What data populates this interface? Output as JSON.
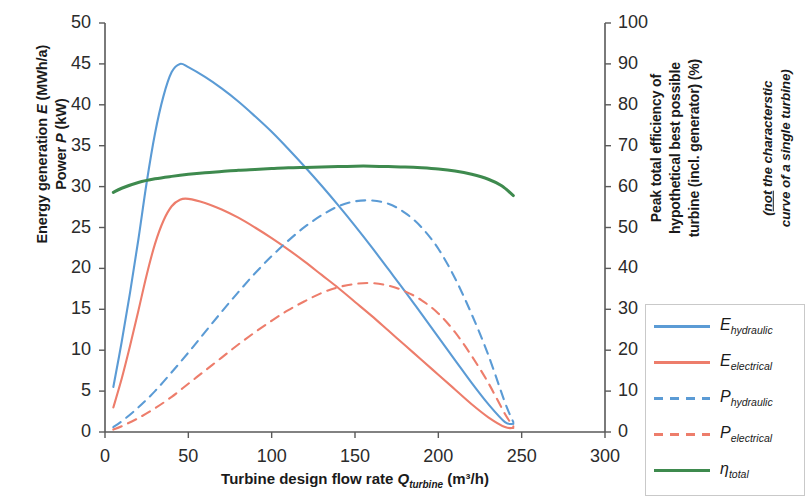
{
  "chart_data": {
    "type": "line",
    "title": "",
    "xlabel": "Turbine design flow rate Q_turbine (m³/h)",
    "ylabel_left": "Energy generation E (MWh/a) / Power P (kW)",
    "ylabel_right": "Peak total efficiency of hypothetical best possible turbine (incl. generator) (%)",
    "xlim": [
      0,
      300
    ],
    "ylim_left": [
      0,
      50
    ],
    "ylim_right": [
      0,
      100
    ],
    "xticks": [
      0,
      50,
      100,
      150,
      200,
      250,
      300
    ],
    "yticks_left": [
      0,
      5,
      10,
      15,
      20,
      25,
      30,
      35,
      40,
      45,
      50
    ],
    "yticks_right": [
      0,
      10,
      20,
      30,
      40,
      50,
      60,
      70,
      80,
      90,
      100
    ],
    "grid": false,
    "legend_position": "right",
    "series": [
      {
        "name": "E_hydraulic",
        "label": "E",
        "subscript": "hydraulic",
        "color": "#5B9BD5",
        "style": "solid",
        "axis": "left",
        "unit": "MWh/a",
        "peak_value": 45.0,
        "peak_x": 45,
        "x": [
          5,
          10,
          15,
          20,
          25,
          30,
          35,
          40,
          45,
          50,
          60,
          70,
          80,
          90,
          100,
          110,
          120,
          130,
          140,
          150,
          160,
          170,
          180,
          190,
          200,
          210,
          220,
          230,
          240,
          245
        ],
        "y": [
          5.5,
          11.0,
          17.0,
          23.5,
          30.5,
          36.5,
          41.0,
          44.0,
          45.0,
          44.6,
          43.4,
          42.0,
          40.4,
          38.6,
          36.7,
          34.6,
          32.4,
          30.1,
          27.7,
          25.2,
          22.6,
          19.9,
          17.2,
          14.4,
          11.6,
          8.8,
          6.0,
          3.4,
          1.2,
          1.0
        ]
      },
      {
        "name": "E_electrical",
        "label": "E",
        "subscript": "electrical",
        "color": "#ED7D6B",
        "style": "solid",
        "axis": "left",
        "unit": "MWh/a",
        "peak_value": 28.5,
        "peak_x": 48,
        "x": [
          5,
          10,
          15,
          20,
          25,
          30,
          35,
          40,
          45,
          50,
          60,
          70,
          80,
          90,
          100,
          110,
          120,
          130,
          140,
          150,
          160,
          170,
          180,
          190,
          200,
          210,
          220,
          230,
          240,
          245
        ],
        "y": [
          3.0,
          6.5,
          10.5,
          14.8,
          19.2,
          23.0,
          25.8,
          27.6,
          28.4,
          28.5,
          28.0,
          27.2,
          26.2,
          25.0,
          23.7,
          22.3,
          20.8,
          19.2,
          17.6,
          15.9,
          14.2,
          12.4,
          10.6,
          8.8,
          7.0,
          5.2,
          3.4,
          1.8,
          0.6,
          0.5
        ]
      },
      {
        "name": "P_hydraulic",
        "label": "P",
        "subscript": "hydraulic",
        "color": "#5B9BD5",
        "style": "dashed",
        "axis": "left",
        "unit": "kW",
        "peak_value": 28.3,
        "peak_x": 155,
        "x": [
          5,
          10,
          20,
          30,
          40,
          50,
          60,
          70,
          80,
          90,
          100,
          110,
          120,
          130,
          140,
          150,
          160,
          170,
          180,
          190,
          200,
          210,
          220,
          230,
          240,
          245
        ],
        "y": [
          0.6,
          1.3,
          3.0,
          5.0,
          7.3,
          9.7,
          12.2,
          14.7,
          17.1,
          19.4,
          21.5,
          23.4,
          25.1,
          26.5,
          27.6,
          28.2,
          28.3,
          27.9,
          26.8,
          25.0,
          22.4,
          18.8,
          14.4,
          9.4,
          3.6,
          1.2
        ]
      },
      {
        "name": "P_electrical",
        "label": "P",
        "subscript": "electrical",
        "color": "#ED7D6B",
        "style": "dashed",
        "axis": "left",
        "unit": "kW",
        "peak_value": 18.2,
        "peak_x": 158,
        "x": [
          5,
          10,
          20,
          30,
          40,
          50,
          60,
          70,
          80,
          90,
          100,
          110,
          120,
          130,
          140,
          150,
          160,
          170,
          180,
          190,
          200,
          210,
          220,
          230,
          240,
          245
        ],
        "y": [
          0.3,
          0.7,
          1.7,
          2.9,
          4.3,
          5.9,
          7.5,
          9.1,
          10.7,
          12.2,
          13.6,
          14.9,
          16.0,
          17.0,
          17.7,
          18.1,
          18.2,
          17.9,
          17.2,
          16.1,
          14.5,
          12.2,
          9.3,
          6.0,
          2.2,
          0.7
        ]
      },
      {
        "name": "eta_total",
        "label": "η",
        "subscript": "total",
        "color": "#3E8A4E",
        "style": "solid",
        "axis": "right",
        "unit": "%",
        "peak_value": 65.0,
        "peak_x": 150,
        "x": [
          5,
          10,
          20,
          30,
          40,
          50,
          60,
          70,
          80,
          90,
          100,
          110,
          120,
          130,
          140,
          150,
          160,
          170,
          180,
          190,
          200,
          210,
          220,
          230,
          238,
          245
        ],
        "y": [
          58.6,
          59.6,
          61.0,
          61.9,
          62.5,
          63.0,
          63.4,
          63.7,
          64.0,
          64.2,
          64.4,
          64.6,
          64.7,
          64.8,
          64.9,
          65.0,
          65.0,
          64.9,
          64.8,
          64.6,
          64.3,
          63.8,
          63.0,
          61.8,
          60.2,
          57.8
        ]
      }
    ]
  },
  "axes": {
    "x_title_parts": {
      "pre": "Turbine design flow rate ",
      "symbol": "Q",
      "sub": "turbine",
      "post": " (m³/h)"
    },
    "left_title_lines": [
      {
        "pre": "Energy generation ",
        "symbol": "E",
        "post": " (MWh/a)"
      },
      {
        "pre": "Power ",
        "symbol": "P",
        "post": " (kW)"
      }
    ],
    "right_title_lines": [
      "Peak total efficiency of",
      "hypothetical best possible",
      "turbine (incl. generator) (%)"
    ],
    "right_note_lines": [
      {
        "open": "(",
        "underline": "not",
        "rest": " the characterstic"
      },
      {
        "open": "",
        "underline": "",
        "rest": "curve of a single turbine)"
      }
    ],
    "x_ticks": [
      "0",
      "50",
      "100",
      "150",
      "200",
      "250",
      "300"
    ],
    "y_ticks_left": [
      "0",
      "5",
      "10",
      "15",
      "20",
      "25",
      "30",
      "35",
      "40",
      "45",
      "50"
    ],
    "y_ticks_right": [
      "0",
      "10",
      "20",
      "30",
      "40",
      "50",
      "60",
      "70",
      "80",
      "90",
      "100"
    ]
  },
  "legend": {
    "entries": [
      {
        "label": "E",
        "sub": "hydraulic",
        "color": "#5B9BD5",
        "style": "solid"
      },
      {
        "label": "E",
        "sub": "electrical",
        "color": "#ED7D6B",
        "style": "solid"
      },
      {
        "label": "P",
        "sub": "hydraulic",
        "color": "#5B9BD5",
        "style": "dashed"
      },
      {
        "label": "P",
        "sub": "electrical",
        "color": "#ED7D6B",
        "style": "dashed"
      },
      {
        "label": "η",
        "sub": "total",
        "color": "#3E8A4E",
        "style": "solid"
      }
    ]
  }
}
